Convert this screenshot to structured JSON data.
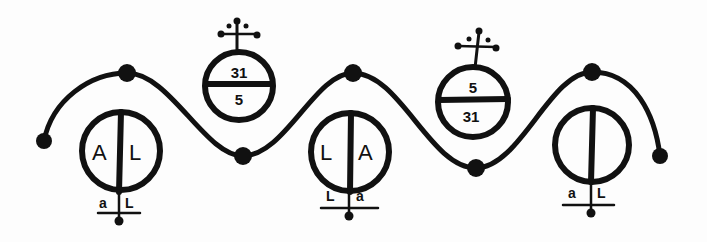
{
  "diagram": {
    "type": "hand-drawn symbolic diagram",
    "ink_color": "#111111",
    "background": "#fdfdfd",
    "wave": {
      "description": "sinusoidal line with dot nodes at crests, troughs and ends",
      "nodes": [
        {
          "role": "left-end",
          "x": 44,
          "y": 141
        },
        {
          "role": "crest",
          "x": 127,
          "y": 73
        },
        {
          "role": "trough",
          "x": 243,
          "y": 156
        },
        {
          "role": "crest",
          "x": 353,
          "y": 73
        },
        {
          "role": "trough",
          "x": 476,
          "y": 168
        },
        {
          "role": "crest",
          "x": 592,
          "y": 72
        },
        {
          "role": "right-end",
          "x": 660,
          "y": 156
        }
      ]
    },
    "lower_symbols": [
      {
        "id": "lower-1",
        "left_letter": "A",
        "right_letter": "L",
        "base_left": "a",
        "base_right": "L"
      },
      {
        "id": "lower-2",
        "left_letter": "L",
        "right_letter": "A",
        "base_left": "L",
        "base_right": "a"
      },
      {
        "id": "lower-3",
        "left_letter": "",
        "right_letter": "",
        "base_left": "a",
        "base_right": "L"
      }
    ],
    "upper_symbols": [
      {
        "id": "upper-1",
        "top_value": "31",
        "bottom_value": "5",
        "crest": "cross-with-dots"
      },
      {
        "id": "upper-2",
        "top_value": "5",
        "bottom_value": "31",
        "crest": "cross-with-dots"
      }
    ]
  }
}
